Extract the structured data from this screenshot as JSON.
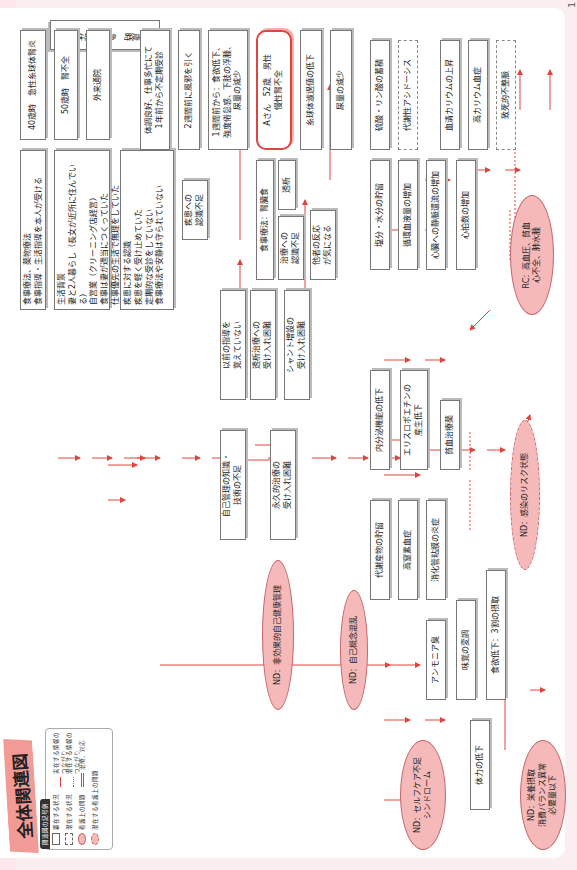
{
  "page": {
    "title": "全体関連図",
    "page_number": "1"
  },
  "legend": {
    "title": "関連図の記号例",
    "items": [
      {
        "symbol": "solid-box",
        "label": "顕在する状況"
      },
      {
        "symbol": "dashed-box",
        "label": "潜在する状況"
      },
      {
        "symbol": "oval",
        "label": "看護上の問題"
      },
      {
        "symbol": "dashed-oval",
        "label": "潜在する看護上の問題"
      },
      {
        "symbol": "solid-arrow",
        "label": "実在する情報のつながり"
      },
      {
        "symbol": "dotted-arrow",
        "label": "潜在する情報のつながり"
      },
      {
        "symbol": "double-arrow",
        "label": "治療、対応"
      }
    ]
  },
  "nodes": {
    "age40": "40歳時　急性糸球体腎炎",
    "age50": "50歳時　腎不全",
    "outpatient": "外来通院",
    "treatment_initial": "食事療法、薬物療法\n食事指導・生活指導を本人が受ける",
    "life_background": "生活背景\n妻と2人暮らし（長女が近所に住んでいる）\n自営業（クリーニング店経営）\n食事は妻が適当につくっていた\n仕事優先の生活で無理をしていた",
    "disease_awareness": "疾患に対する認識\n疾患を軽く受け止めていた\n定期的な受診をしていない\n食事療法や安静は守られていない",
    "disease_insufficient": "疾患への\n認識不足",
    "health_good": "体調良好、仕事多忙にて\n1年前から不定期受診",
    "cold": "2週間前に風邪を引く",
    "one_week": "1週間前から：食欲低下、\n強度倦怠感、下肢の浮腫、\n尿量の減少",
    "patient": "Aさん　52歳　男性\n慢性腎不全",
    "diet_med": "食事療法：腎臓食",
    "dialysis": "透析",
    "treatment_insufficient": "治療への\n認識不足",
    "others_reaction": "他者の反応\nが気になる",
    "not_remember": "以前の指導を\n覚えていない",
    "dialysis_acceptance": "透析治療への\n受け入れ困難",
    "shunt_acceptance": "シャント増設の\n受け入れ困難",
    "self_mgmt_lack": "自己管理の知識・\n技術の不足",
    "permanent_acceptance": "永久的治療の\n受け入れ困難",
    "gfr_down": "糸球体濾過値の低下",
    "urine_down": "尿量の減少",
    "salt_water": "塩分・水分の貯留",
    "circ_blood": "循環血液量の増加",
    "venous_return": "心臓への静脈還流の増加",
    "heart_rate": "心拍数の増加",
    "sulfate": "硫酸・リン酸の蓄積",
    "acidosis": "代謝性アシドーシス",
    "potassium_up": "血清カリウムの上昇",
    "hyperkalemia": "高カリウム血症",
    "arrhythmia": "致死的不整脈",
    "nephron_down": "機能性ネフロンの減少",
    "renin": "レニン・アンジオテンシンの活性",
    "bp_up": "血圧の上昇",
    "endocrine_down": "内分泌機能の低下",
    "epo_down": "エリスロポエチンの\n産生低下",
    "anemia_tx": "貧血治療薬",
    "metabolite": "代謝産物の貯留",
    "uremia": "高窒素血症",
    "gi_inflammation": "消化管粘膜の炎症",
    "ammonia": "アンモニア臭",
    "taste_change": "味覚の変調",
    "appetite_down": "食欲低下：3割の摂取",
    "stamina_down": "体力の低下"
  },
  "problems": {
    "nd_ineffective_health": "ND：非効果的自己健康管理",
    "nd_self_concept": "ND：自己概念混乱",
    "nd_selfcare": "ND：セルフケア不足\nシンドローム",
    "nd_nutrition": "ND：栄養摂取\n消費バランス異常\n必要量以下",
    "nd_infection": "ND：感染のリスク状態",
    "rc": "RC：高血圧、貧血\n心不全、肺水腫"
  },
  "colors": {
    "arrow": "#e0443f",
    "problem_fill": "#f6b9b9",
    "problem_border": "#c4656a",
    "title_tag": "#f29a95",
    "page_bg": "#fbeef0"
  }
}
